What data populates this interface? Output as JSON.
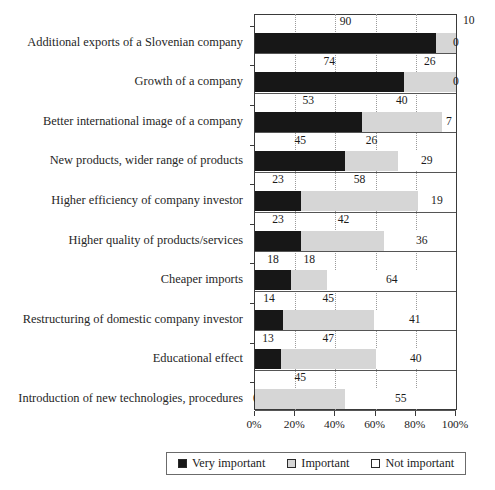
{
  "chart_data": {
    "type": "bar",
    "orientation": "horizontal",
    "stacked": true,
    "normalized_percent": true,
    "title": "",
    "xlabel": "",
    "ylabel": "",
    "xlim": [
      0,
      100
    ],
    "grid": "vertical dotted gridlines at 20% intervals",
    "legend_position": "bottom",
    "xticks": [
      "0%",
      "20%",
      "40%",
      "60%",
      "80%",
      "100%"
    ],
    "xtick_values": [
      0,
      20,
      40,
      60,
      80,
      100
    ],
    "categories": [
      "Additional exports of a Slovenian company",
      "Growth of a company",
      "Better international image of a company",
      "New products, wider range of products",
      "Higher efficiency of company investor",
      "Higher quality of products/services",
      "Cheaper imports",
      "Restructuring of domestic company investor",
      "Educational effect",
      "Introduction of new technologies, procedures"
    ],
    "series": [
      {
        "name": "Very important",
        "color": "#171717",
        "values": [
          90,
          74,
          53,
          45,
          23,
          23,
          18,
          14,
          13,
          0
        ]
      },
      {
        "name": "Important",
        "color": "#d6d6d6",
        "values": [
          10,
          26,
          40,
          26,
          58,
          42,
          18,
          45,
          47,
          45
        ]
      },
      {
        "name": "Not important",
        "color": "#ffffff",
        "values": [
          0,
          0,
          7,
          29,
          19,
          36,
          64,
          41,
          40,
          55
        ]
      }
    ]
  },
  "legend": {
    "items": [
      {
        "label": "Very important",
        "swatch": "black-square-icon"
      },
      {
        "label": "Important",
        "swatch": "gray-square-icon"
      },
      {
        "label": "Not important",
        "swatch": "white-square-icon"
      }
    ]
  },
  "colors": {
    "very_important": "#171717",
    "important": "#d6d6d6",
    "not_important": "#ffffff",
    "axis": "#3a3a3a",
    "gridline": "#9a9a9a",
    "text": "#1b1b1b"
  }
}
